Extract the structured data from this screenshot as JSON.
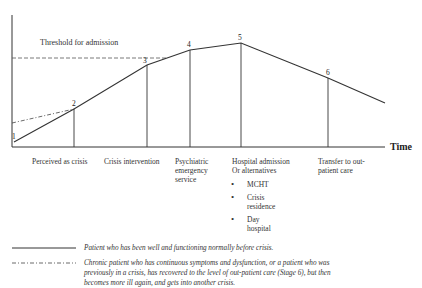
{
  "diagram": {
    "threshold_label": "Threshold for admission",
    "axis_label": "Time",
    "points": [
      {
        "id": "1",
        "label": "1"
      },
      {
        "id": "2",
        "label": "2"
      },
      {
        "id": "3",
        "label": "3"
      },
      {
        "id": "4",
        "label": "4"
      },
      {
        "id": "5",
        "label": "5"
      },
      {
        "id": "6",
        "label": "6"
      }
    ],
    "stages": [
      {
        "label": "Perceived as crisis"
      },
      {
        "label": "Crisis intervention"
      },
      {
        "label": "Psychiatric emergency service"
      },
      {
        "label": "Hospital admission Or alternatives"
      },
      {
        "label": "Transfer to out-patient care"
      }
    ],
    "alternatives": [
      "MCHT",
      "Crisis residence",
      "Day hospital"
    ],
    "legend": [
      {
        "style": "solid",
        "text": "Patient who has been well and functioning normally before crisis."
      },
      {
        "style": "dash-dot",
        "text": "Chronic patient who has continuous symptoms and dysfunction, or a patient who was previously in a crisis, has recovered to the level of out-patient care (Stage 6), but then becomes more ill again, and gets into another crisis."
      }
    ]
  }
}
